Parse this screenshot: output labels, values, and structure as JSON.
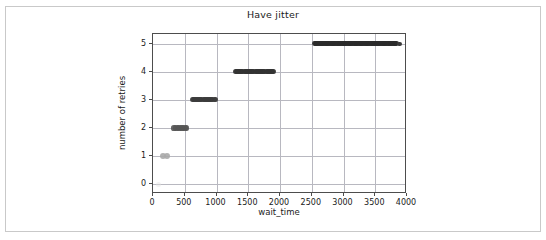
{
  "figure": {
    "background": "#ffffff",
    "border_color": "#c9c9c9"
  },
  "chart_data": {
    "type": "scatter",
    "title": "Have jitter",
    "xlabel": "wait_time",
    "ylabel": "number of retries",
    "xlim": [
      0,
      4000
    ],
    "ylim": [
      -0.35,
      5.35
    ],
    "grid": true,
    "legend": null,
    "x_ticks": [
      0,
      500,
      1000,
      1500,
      2000,
      2500,
      3000,
      3500,
      4000
    ],
    "x_tick_labels": [
      "0",
      "500",
      "1000",
      "1500",
      "2000",
      "2500",
      "3000",
      "3500",
      "4000"
    ],
    "y_ticks": [
      0,
      1,
      2,
      3,
      4,
      5
    ],
    "y_tick_labels": [
      "0",
      "1",
      "2",
      "3",
      "4",
      "5"
    ],
    "marker": "circle",
    "marker_color": "#3a3a3a",
    "series": [
      {
        "name": "retries vs wait_time",
        "clusters": [
          {
            "retries": 0,
            "x_min": 90,
            "x_max": 160,
            "density": "very-low",
            "color": "#e3e3e3"
          },
          {
            "retries": 1,
            "x_min": 150,
            "x_max": 255,
            "density": "low",
            "color": "#a9a9a9"
          },
          {
            "retries": 2,
            "x_min": 330,
            "x_max": 535,
            "density": "medium",
            "color": "#555555"
          },
          {
            "retries": 3,
            "x_min": 615,
            "x_max": 985,
            "density": "high",
            "color": "#3c3c3c"
          },
          {
            "retries": 4,
            "x_min": 1295,
            "x_max": 1905,
            "density": "high",
            "color": "#333333"
          },
          {
            "retries": 5,
            "x_min": 2540,
            "x_max": 3845,
            "density": "very-high",
            "color": "#2b2b2b"
          }
        ],
        "outliers": [
          {
            "x": 3880,
            "y": 5
          }
        ]
      }
    ]
  }
}
